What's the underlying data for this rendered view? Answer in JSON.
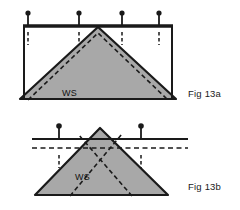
{
  "page": {
    "width": 240,
    "height": 210,
    "background": "#ffffff",
    "kind": "technical-illustration"
  },
  "colors": {
    "ink": "#1a1a1a",
    "roof_fill": "#a8a8a8",
    "roof_outline": "#1a1a1a",
    "dashed_line": "#1a1a1a",
    "caption_text": "#1a1a1a",
    "label_text": "#111111",
    "page_background": "#ffffff"
  },
  "figures": [
    {
      "id": "fig-13a",
      "caption": "Fig 13a",
      "caption_position": {
        "x": 188,
        "y": 97
      },
      "label": "WS",
      "label_position": {
        "x": 62,
        "y": 96
      },
      "description": "Gable roof truss shown inside a rectangular frame with a heavy horizontal top rail carrying four pins, short dashed drop marks beneath each pin, and a dashed line running parallel just inside the roof slopes.",
      "top_rail": {
        "x1": 24,
        "y1": 26,
        "x2": 172,
        "y2": 26,
        "thickness": 3
      },
      "frame_verticals": [
        {
          "x": 24,
          "y1": 26,
          "y2": 99
        },
        {
          "x": 172,
          "y1": 26,
          "y2": 99
        }
      ],
      "baseline": {
        "x1": 20,
        "y1": 99,
        "x2": 176,
        "y2": 99
      },
      "pins": [
        {
          "head_x": 28,
          "head_y": 13,
          "stem_bottom": 26
        },
        {
          "head_x": 79,
          "head_y": 13,
          "stem_bottom": 26
        },
        {
          "head_x": 122,
          "head_y": 13,
          "stem_bottom": 26
        },
        {
          "head_x": 159,
          "head_y": 13,
          "stem_bottom": 26
        }
      ],
      "drop_marks": [
        {
          "x": 28,
          "y1": 32,
          "y2": 45
        },
        {
          "x": 79,
          "y1": 32,
          "y2": 45
        },
        {
          "x": 122,
          "y1": 32,
          "y2": 45
        },
        {
          "x": 159,
          "y1": 32,
          "y2": 45
        }
      ],
      "roof": {
        "apex": {
          "x": 98,
          "y": 27
        },
        "left_eave": {
          "x": 20,
          "y": 99
        },
        "right_eave": {
          "x": 176,
          "y": 99
        }
      },
      "inner_dashed": {
        "apex": {
          "x": 98,
          "y": 33
        },
        "left_eave": {
          "x": 28,
          "y": 100
        },
        "right_eave": {
          "x": 168,
          "y": 100
        }
      }
    },
    {
      "id": "fig-13b",
      "caption": "Fig 13b",
      "caption_position": {
        "x": 188,
        "y": 190
      },
      "label": "WS",
      "label_position": {
        "x": 75,
        "y": 180
      },
      "description": "Gable roof truss crossed by a solid horizontal ceiling line and a dashed line just below it; two pins stand on the solid line and dashed diagonals cross near the apex running down to the opposite eaves.",
      "solid_line": {
        "x1": 32,
        "y1": 139,
        "x2": 188,
        "y2": 139
      },
      "dashed_line": {
        "x1": 32,
        "y1": 148,
        "x2": 188,
        "y2": 148
      },
      "pins": [
        {
          "head_x": 59,
          "head_y": 126,
          "stem_bottom": 139
        },
        {
          "head_x": 141,
          "head_y": 126,
          "stem_bottom": 139
        }
      ],
      "drop_marks": [
        {
          "x": 59,
          "y1": 155,
          "y2": 168
        },
        {
          "x": 141,
          "y1": 155,
          "y2": 168
        }
      ],
      "roof": {
        "apex": {
          "x": 100,
          "y": 128
        },
        "left_eave": {
          "x": 35,
          "y": 195
        },
        "right_eave": {
          "x": 168,
          "y": 195
        }
      },
      "crossing_dashed": [
        {
          "x1": 70,
          "y1": 196,
          "x2": 122,
          "y2": 134
        },
        {
          "x1": 132,
          "y1": 196,
          "x2": 78,
          "y2": 134
        }
      ]
    }
  ]
}
